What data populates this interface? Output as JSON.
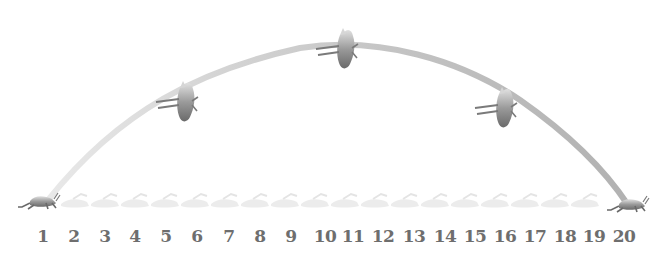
{
  "diagram": {
    "number_line": {
      "labels": [
        "1",
        "2",
        "3",
        "4",
        "5",
        "6",
        "7",
        "8",
        "9",
        "10",
        "11",
        "12",
        "13",
        "14",
        "15",
        "16",
        "17",
        "18",
        "19",
        "20"
      ],
      "label_color": "#6e6e6e"
    },
    "arc": {
      "start_label": "1",
      "end_label": "20",
      "color": "#b8b8b8"
    },
    "figures": [
      {
        "name": "grasshopper-start",
        "position_label": "1",
        "pose": "crouching"
      },
      {
        "name": "grasshopper-rising",
        "position_label": "6",
        "pose": "flying"
      },
      {
        "name": "grasshopper-peak",
        "position_label": "11",
        "pose": "flying"
      },
      {
        "name": "grasshopper-descending",
        "position_label": "16",
        "pose": "flying"
      },
      {
        "name": "grasshopper-landing",
        "position_label": "20",
        "pose": "crouching"
      }
    ]
  }
}
